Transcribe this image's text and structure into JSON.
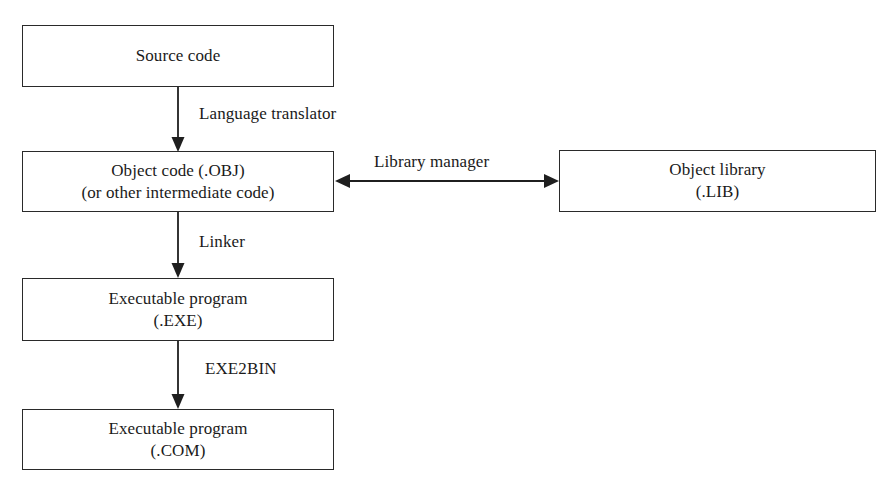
{
  "diagram": {
    "canvas": {
      "width": 893,
      "height": 497,
      "background": "#ffffff"
    },
    "ink_color": "#1f1f1f",
    "nodes": [
      {
        "id": "source-code",
        "line1": "Source code",
        "line2": ""
      },
      {
        "id": "object-code",
        "line1": "Object code (.OBJ)",
        "line2": "(or other intermediate code)"
      },
      {
        "id": "object-library",
        "line1": "Object library",
        "line2": "(.LIB)"
      },
      {
        "id": "executable-exe",
        "line1": "Executable program",
        "line2": "(.EXE)"
      },
      {
        "id": "executable-com",
        "line1": "Executable program",
        "line2": "(.COM)"
      }
    ],
    "edges": [
      {
        "id": "language-translator",
        "label": "Language translator",
        "from": "source-code",
        "to": "object-code",
        "direction": "down"
      },
      {
        "id": "library-manager",
        "label": "Library manager",
        "from": "object-code",
        "to": "object-library",
        "direction": "bidirectional"
      },
      {
        "id": "linker",
        "label": "Linker",
        "from": "object-code",
        "to": "executable-exe",
        "direction": "down"
      },
      {
        "id": "exe2bin",
        "label": "EXE2BIN",
        "from": "executable-exe",
        "to": "executable-com",
        "direction": "down"
      }
    ]
  }
}
